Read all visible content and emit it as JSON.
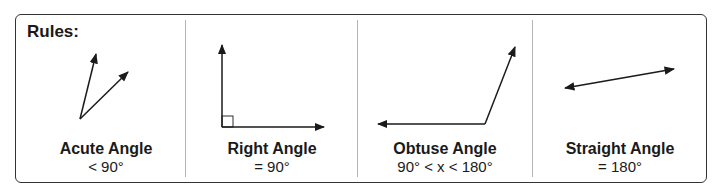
{
  "header": {
    "title": "Rules:"
  },
  "colors": {
    "line": "#1a1a1a",
    "border": "#333333",
    "divider": "#b5b5b5"
  },
  "panels": [
    {
      "name": "Acute Angle",
      "rule": "< 90°"
    },
    {
      "name": "Right Angle",
      "rule": "= 90°"
    },
    {
      "name": "Obtuse Angle",
      "rule": "90° < x < 180°"
    },
    {
      "name": "Straight Angle",
      "rule": "= 180°"
    }
  ]
}
